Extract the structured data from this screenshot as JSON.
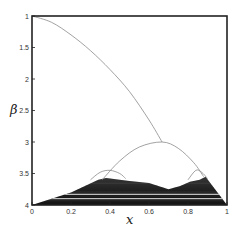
{
  "chart_data": {
    "type": "line",
    "title": "",
    "xlabel": "x",
    "ylabel": "β",
    "xlim": [
      0,
      1
    ],
    "ylim": [
      4,
      1
    ],
    "y_inverted": true,
    "grid": false,
    "legend": null,
    "x_ticks": [
      "0",
      "0.2",
      "0.4",
      "0.6",
      "0.8",
      "1"
    ],
    "y_ticks": [
      "1",
      "1.5",
      "2",
      "2.5",
      "3",
      "3.5",
      "4"
    ],
    "series": [
      {
        "name": "main branch",
        "style": "thin gray line",
        "points": [
          [
            0,
            1
          ],
          [
            0.1,
            1.1
          ],
          [
            0.2,
            1.3
          ],
          [
            0.3,
            1.55
          ],
          [
            0.4,
            1.85
          ],
          [
            0.5,
            2.2
          ],
          [
            0.6,
            2.65
          ],
          [
            0.667,
            3.0
          ]
        ]
      },
      {
        "name": "central arc",
        "style": "thin gray line",
        "points": [
          [
            0.36,
            3.6
          ],
          [
            0.45,
            3.3
          ],
          [
            0.55,
            3.08
          ],
          [
            0.667,
            3.0
          ],
          [
            0.75,
            3.1
          ],
          [
            0.83,
            3.33
          ],
          [
            0.88,
            3.55
          ]
        ]
      },
      {
        "name": "left small arc",
        "style": "thin gray line",
        "points": [
          [
            0.3,
            3.6
          ],
          [
            0.35,
            3.48
          ],
          [
            0.4,
            3.45
          ],
          [
            0.45,
            3.5
          ],
          [
            0.48,
            3.58
          ]
        ]
      },
      {
        "name": "right small arc",
        "style": "thin gray line",
        "points": [
          [
            0.8,
            3.6
          ],
          [
            0.84,
            3.45
          ],
          [
            0.87,
            3.48
          ],
          [
            0.9,
            3.58
          ]
        ]
      },
      {
        "name": "chaotic region",
        "style": "dark filled band",
        "upper_boundary": [
          [
            0,
            4.0
          ],
          [
            0.2,
            3.8
          ],
          [
            0.34,
            3.6
          ],
          [
            0.38,
            3.57
          ],
          [
            0.5,
            3.62
          ],
          [
            0.6,
            3.65
          ],
          [
            0.7,
            3.75
          ],
          [
            0.76,
            3.7
          ],
          [
            0.81,
            3.63
          ],
          [
            0.86,
            3.6
          ],
          [
            0.89,
            3.55
          ],
          [
            1.0,
            4.0
          ]
        ],
        "white_bands_beta": [
          3.83,
          3.9
        ]
      }
    ]
  }
}
